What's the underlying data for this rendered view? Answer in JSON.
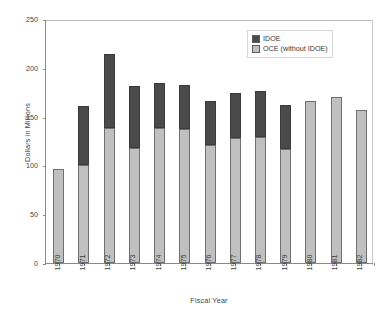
{
  "chart_data": {
    "type": "bar",
    "stacked": true,
    "title": "",
    "xlabel": "Fiscal Year",
    "ylabel": "Dollars in Millions",
    "categories": [
      "1970",
      "1971",
      "1972",
      "1973",
      "1974",
      "1975",
      "1976",
      "1977",
      "1978",
      "1979",
      "1980",
      "1981",
      "1982"
    ],
    "series": [
      {
        "name": "OCE (without IDOE)",
        "color": "#c0c0c0",
        "values": [
          96,
          100,
          138,
          118,
          138,
          137,
          121,
          128,
          129,
          117,
          166,
          170,
          157
        ]
      },
      {
        "name": "IDOE",
        "color": "#4a4a4a",
        "values": [
          0,
          61,
          76,
          63,
          46,
          45,
          45,
          46,
          47,
          45,
          0,
          0,
          0
        ]
      }
    ],
    "totals": [
      96,
      161,
      214,
      181,
      184,
      182,
      166,
      174,
      176,
      162,
      166,
      170,
      157
    ],
    "ylim": [
      0,
      250
    ],
    "yticks": [
      0,
      50,
      100,
      150,
      200,
      250
    ],
    "ytick_labels": [
      "0",
      "50",
      "100",
      "150",
      "200",
      "250"
    ],
    "grid": false,
    "legend_position": "top-right",
    "legend_entries": [
      {
        "label": "IDOE",
        "swatch": "dark"
      },
      {
        "label": "OCE (without IDOE)",
        "swatch": "light"
      }
    ]
  }
}
